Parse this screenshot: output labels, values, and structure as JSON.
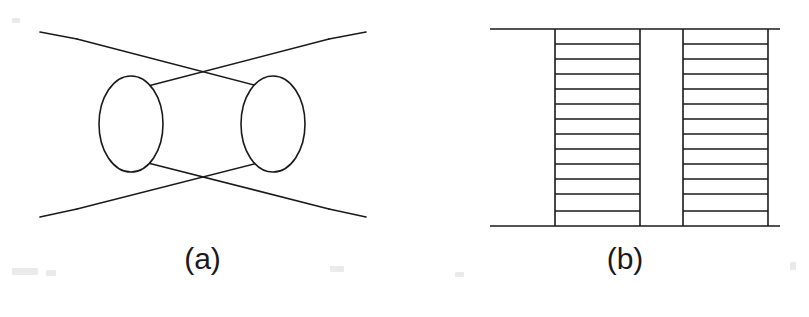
{
  "figure": {
    "background_color": "#ffffff",
    "ink_color": "#1a1a1a",
    "width": 809,
    "height": 317,
    "panels": [
      {
        "id": "a",
        "caption": "(a)",
        "type": "crossed-blob-exchange-diagram",
        "description": "Two vertical ellipse blobs joined by crossing internal lines with four external legs",
        "stroke_width": 1.6,
        "ellipses": [
          {
            "name": "left-blob",
            "cx": 131,
            "cy": 124,
            "rx": 32,
            "ry": 48
          },
          {
            "name": "right-blob",
            "cx": 273,
            "cy": 124,
            "rx": 32,
            "ry": 48
          }
        ],
        "vertices": [
          {
            "name": "left-outer-vertex",
            "x": 77,
            "y": 39
          },
          {
            "name": "right-outer-vertex",
            "x": 329,
            "y": 39
          },
          {
            "name": "left-lower-vertex",
            "x": 77,
            "y": 209
          },
          {
            "name": "right-lower-vertex",
            "x": 329,
            "y": 209
          },
          {
            "name": "top-cross-point",
            "x": 203,
            "y": 71
          },
          {
            "name": "bottom-cross-point",
            "x": 191,
            "y": 186
          }
        ],
        "lines": [
          {
            "name": "external-leg-top-left",
            "x1": 40,
            "y1": 32,
            "x2": 77,
            "y2": 39
          },
          {
            "name": "external-leg-top-right",
            "x1": 329,
            "y1": 39,
            "x2": 366,
            "y2": 32
          },
          {
            "name": "external-leg-bottom-left",
            "x1": 40,
            "y1": 217,
            "x2": 77,
            "y2": 209
          },
          {
            "name": "external-leg-bottom-right",
            "x1": 329,
            "y1": 209,
            "x2": 366,
            "y2": 217
          },
          {
            "name": "upper-cross-line-left",
            "x1": 77,
            "y1": 39,
            "x2": 258,
            "y2": 86
          },
          {
            "name": "upper-cross-line-right",
            "x1": 329,
            "y1": 39,
            "x2": 148,
            "y2": 86
          },
          {
            "name": "lower-cross-line-left",
            "x1": 77,
            "y1": 209,
            "x2": 258,
            "y2": 163
          },
          {
            "name": "lower-cross-line-right",
            "x1": 329,
            "y1": 209,
            "x2": 148,
            "y2": 163
          }
        ]
      },
      {
        "id": "b",
        "caption": "(b)",
        "type": "double-ladder-diagram",
        "description": "Two ladder (rung) blocks between a top and bottom horizontal rail",
        "stroke_width": 1.6,
        "rails": [
          {
            "name": "top-rail",
            "x1": 85,
            "y1": 29,
            "x2": 375,
            "y2": 29
          },
          {
            "name": "bottom-rail",
            "x1": 85,
            "y1": 226,
            "x2": 375,
            "y2": 226
          }
        ],
        "ladders": [
          {
            "name": "left-ladder",
            "left_x": 150,
            "right_x": 235,
            "top_y": 29,
            "bottom_y": 226,
            "rung_count": 13,
            "rung_y": [
              29,
              44,
              59,
              74,
              89,
              104,
              119,
              134,
              149,
              164,
              179,
              194,
              211,
              226
            ]
          },
          {
            "name": "right-ladder",
            "left_x": 278,
            "right_x": 363,
            "top_y": 29,
            "bottom_y": 226,
            "rung_count": 13,
            "rung_y": [
              29,
              44,
              59,
              74,
              89,
              104,
              119,
              134,
              149,
              164,
              179,
              194,
              211,
              226
            ]
          }
        ]
      }
    ]
  }
}
